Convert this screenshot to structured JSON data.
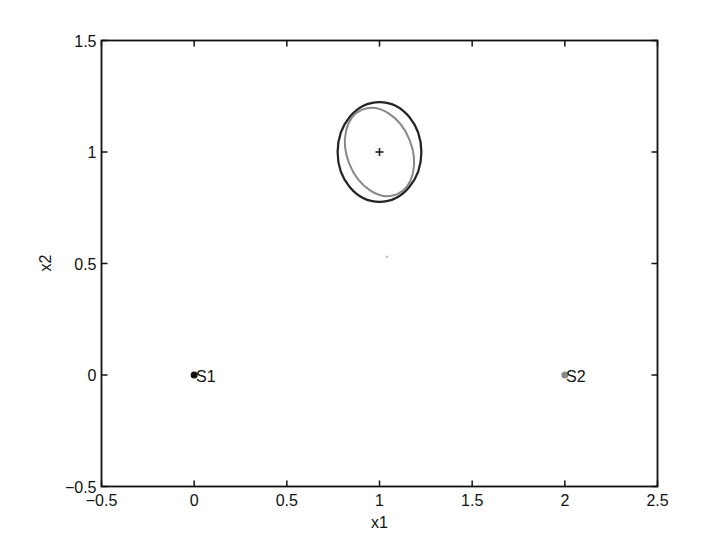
{
  "chart_data": {
    "type": "scatter",
    "title": "",
    "xlabel": "x1",
    "ylabel": "x2",
    "xlim": [
      -0.5,
      2.5
    ],
    "ylim": [
      -0.5,
      1.5
    ],
    "grid": false,
    "legend": null,
    "xticks": [
      -0.5,
      0,
      0.5,
      1,
      1.5,
      2,
      2.5
    ],
    "xtick_labels": [
      "−0.5",
      "0",
      "0.5",
      "1",
      "1.5",
      "2",
      "2.5"
    ],
    "yticks": [
      -0.5,
      0,
      0.5,
      1,
      1.5
    ],
    "ytick_labels": [
      "−0.5",
      "0",
      "0.5",
      "1",
      "1.5"
    ],
    "points": [
      {
        "name": "S1",
        "x": 0,
        "y": 0,
        "color": "#111111",
        "marker": "dot",
        "label": "S1"
      },
      {
        "name": "S2",
        "x": 2,
        "y": 0,
        "color": "#888888",
        "marker": "dot",
        "label": "S2"
      },
      {
        "name": "estimate",
        "x": 1,
        "y": 1,
        "color": "#222222",
        "marker": "plus"
      },
      {
        "name": "stray",
        "x": 1.04,
        "y": 0.53,
        "color": "#bbbbbb",
        "marker": "small-dot"
      }
    ],
    "ellipses": [
      {
        "name": "dark-ellipse",
        "cx": 1,
        "cy": 1,
        "rx": 0.226,
        "ry": 0.224,
        "angle_deg": 0,
        "color": "#222222"
      },
      {
        "name": "grey-ellipse",
        "cx": 1,
        "cy": 1,
        "rx": 0.175,
        "ry": 0.205,
        "angle_deg": -22,
        "color": "#888888"
      }
    ]
  },
  "axes": {
    "x_label": "x1",
    "y_label": "x2"
  },
  "annotations": {
    "s1": "S1",
    "s2": "S2"
  }
}
